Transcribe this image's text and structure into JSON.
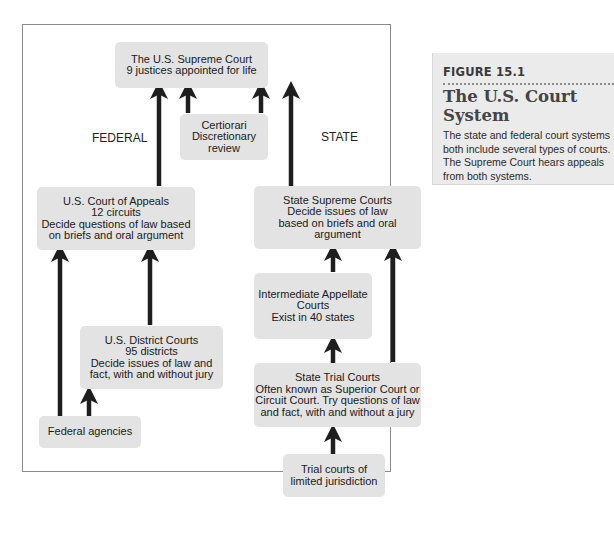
{
  "figure": {
    "number": "FIGURE 15.1",
    "title": "The U.S. Court System",
    "caption": "The state and federal court systems both include several types of courts. The Supreme Court hears appeals from both systems."
  },
  "labels": {
    "federal": "FEDERAL",
    "state": "STATE"
  },
  "boxes": {
    "supreme": {
      "lines": [
        "The U.S. Supreme Court",
        "9 justices appointed for life"
      ]
    },
    "certiorari": {
      "lines": [
        "Certiorari",
        "Discretionary",
        "review"
      ]
    },
    "appeals": {
      "lines": [
        "U.S. Court of Appeals",
        "12 circuits",
        "Decide questions of law based",
        "on briefs and oral argument"
      ]
    },
    "state_supreme": {
      "lines": [
        "State Supreme Courts",
        "Decide issues of law",
        "based on briefs and oral",
        "argument"
      ]
    },
    "intermediate": {
      "lines": [
        "Intermediate Appellate",
        "Courts",
        "Exist in 40 states"
      ]
    },
    "district": {
      "lines": [
        "U.S. District Courts",
        "95 districts",
        "Decide issues of law and",
        "fact, with and without jury"
      ]
    },
    "state_trial": {
      "lines": [
        "State Trial Courts",
        "Often known as Superior Court or",
        "Circuit Court. Try questions of law",
        "and fact, with and without a jury"
      ]
    },
    "federal_agencies": {
      "lines": [
        "Federal agencies"
      ]
    },
    "limited": {
      "lines": [
        "Trial courts of",
        "limited jurisdiction"
      ]
    }
  },
  "colors": {
    "box": "#e3e3e3",
    "arrow": "#1e1e1e",
    "frame": "#8a8a8a",
    "sidebar": "#ebebeb"
  }
}
